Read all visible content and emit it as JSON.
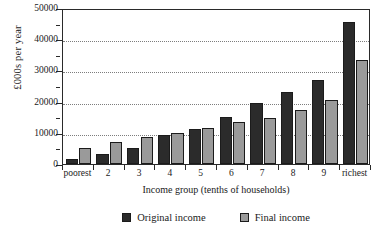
{
  "chart_data": {
    "type": "bar",
    "title": "",
    "xlabel": "Income group (tenths of households)",
    "ylabel": "£000s per year",
    "categories": [
      "poorest",
      "2",
      "3",
      "4",
      "5",
      "6",
      "7",
      "8",
      "9",
      "richest"
    ],
    "series": [
      {
        "name": "Original income",
        "color": "#2b2b2b",
        "values": [
          1500,
          3200,
          5100,
          9400,
          11300,
          15000,
          19400,
          23000,
          27000,
          45500
        ]
      },
      {
        "name": "Final income",
        "color": "#9a9a9a",
        "values": [
          5100,
          7000,
          8600,
          10000,
          11600,
          13400,
          14700,
          17400,
          20500,
          33300
        ]
      }
    ],
    "ylim": [
      0,
      50000
    ],
    "ytick_labels": [
      "0",
      "10000",
      "20000",
      "30000",
      "40000",
      "50000"
    ],
    "ytick_values": [
      0,
      10000,
      20000,
      30000,
      40000,
      50000
    ],
    "yminor_values": [
      5000,
      15000,
      25000,
      35000,
      45000
    ],
    "grid": true,
    "grid_axis": "y",
    "legend_position": "bottom",
    "legend_entries": [
      "Original income",
      "Final income"
    ]
  }
}
